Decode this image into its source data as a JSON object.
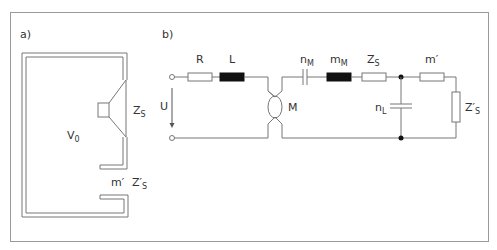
{
  "panel_a": {
    "label": "a)",
    "volume_label": "V",
    "volume_sub": "0",
    "membrane_label": "Z",
    "membrane_sub": "S",
    "port_mass_label": "m′",
    "port_imp_label": "Z′",
    "port_imp_sub": "S"
  },
  "panel_b": {
    "label": "b)",
    "R": "R",
    "L": "L",
    "nM": "n",
    "nM_sub": "M",
    "mM": "m",
    "mM_sub": "M",
    "ZS": "Z",
    "ZS_sub": "S",
    "mprime": "m′",
    "nL": "n",
    "nL_sub": "L",
    "ZpS": "Z′",
    "ZpS_sub": "S",
    "U": "U",
    "M": "M"
  },
  "colors": {
    "line": "#777777",
    "frame": "#999999",
    "fill_black": "#111111",
    "text": "#333333"
  }
}
